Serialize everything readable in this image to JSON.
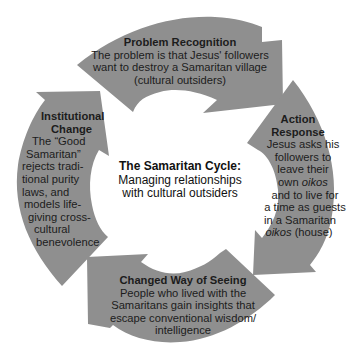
{
  "diagram": {
    "type": "cycle",
    "fill_color": "#8f8f8f",
    "background": "#ffffff",
    "center": {
      "title": "The Samaritan Cycle:",
      "subtitle_line1": "Managing relationships",
      "subtitle_line2": "with cultural outsiders"
    },
    "stages": [
      {
        "id": "problem-recognition",
        "position": "top",
        "title": "Problem Recognition",
        "lines": [
          "The problem is that Jesus' followers",
          "want to destroy a Samaritan village",
          "(cultural outsiders)"
        ]
      },
      {
        "id": "action-response",
        "position": "right",
        "title_line1": "Action",
        "title_line2": "Response",
        "lines": [
          "Jesus asks his",
          "followers to",
          "leave their",
          "own",
          "oikos",
          "and to live for",
          "a time as guests",
          "in a Samaritan",
          "oikos",
          "(house)"
        ]
      },
      {
        "id": "changed-way-of-seeing",
        "position": "bottom",
        "title": "Changed Way of Seeing",
        "lines": [
          "People who lived with the",
          "Samaritans gain insights that",
          "escape conventional wisdom/",
          "intelligence"
        ]
      },
      {
        "id": "institutional-change",
        "position": "left",
        "title_line1": "Institutional",
        "title_line2": "Change",
        "lines": [
          "The “Good",
          "Samaritan”",
          "rejects tradi-",
          "tional purity",
          "laws, and",
          "models life-",
          "giving cross-",
          "cultural",
          "benevolence"
        ]
      }
    ],
    "flow_direction": "clockwise"
  }
}
